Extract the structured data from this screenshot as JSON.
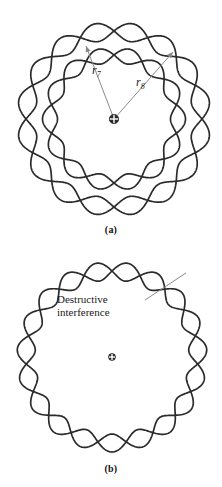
{
  "figure": {
    "background_color": "#ffffff",
    "stroke_color": "#2b2b2b",
    "leader_color": "#8a8a8a",
    "nucleus_color": "#2b2b2b"
  },
  "panel_a": {
    "caption": "(a)",
    "nucleus_icon": "circled-plus-icon",
    "nucleus": {
      "cx": 114,
      "cy": 119
    },
    "labels": {
      "r7": {
        "text": "r",
        "subscript": "7",
        "x": 92,
        "y": 64
      },
      "r8": {
        "text": "r",
        "subscript": "8",
        "x": 136,
        "y": 76
      }
    },
    "arrows": [
      {
        "name": "radius-arrow-r7",
        "x1": 114,
        "y1": 119,
        "x2": 86,
        "y2": 46
      },
      {
        "name": "radius-arrow-r8",
        "x1": 114,
        "y1": 119,
        "x2": 173,
        "y2": 52
      }
    ],
    "orbits": [
      {
        "name": "inner-orbit-n7",
        "radius": 64,
        "lobes": 7,
        "amplitude": 7.5,
        "center": {
          "cx": 114,
          "cy": 119
        },
        "constructive": true
      },
      {
        "name": "outer-orbit-n8",
        "radius": 88,
        "lobes": 8,
        "amplitude": 9,
        "center": {
          "cx": 114,
          "cy": 119
        },
        "constructive": true
      }
    ]
  },
  "panel_b": {
    "caption": "(b)",
    "nucleus_icon": "circled-plus-icon",
    "nucleus": {
      "cx": 112,
      "cy": 357
    },
    "callout": {
      "line1": "Destructive",
      "line2": "interference",
      "leader": {
        "x1": 145,
        "y1": 300,
        "x2": 186,
        "y2": 273
      }
    },
    "orbits": [
      {
        "name": "open-orbit-destructive",
        "radius": 86,
        "lobes": 9.5,
        "amplitude": 9,
        "center": {
          "cx": 112,
          "cy": 357
        },
        "constructive": false
      }
    ]
  },
  "chart_data": {
    "type": "line",
    "xlabel": "",
    "ylabel": "",
    "series": [
      {
        "name": "inner-orbit-n7",
        "panel": "(a)",
        "radius": 64,
        "wavelengths": 7,
        "amplitude": 7.5,
        "closed": true
      },
      {
        "name": "outer-orbit-n8",
        "panel": "(a)",
        "radius": 88,
        "wavelengths": 8,
        "amplitude": 9,
        "closed": true
      },
      {
        "name": "open-orbit-destructive",
        "panel": "(b)",
        "radius": 86,
        "wavelengths": 9.5,
        "amplitude": 9,
        "closed": false
      }
    ],
    "annotations": [
      "r7",
      "r8",
      "Destructive interference",
      "(a)",
      "(b)"
    ]
  }
}
